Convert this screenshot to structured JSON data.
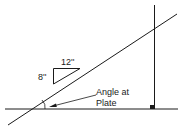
{
  "diagram": {
    "pitch_triangle": {
      "run_label": "12''",
      "rise_label": "8''"
    },
    "callout": {
      "line1": "Angle at",
      "line2": "Plate"
    },
    "colors": {
      "stroke": "#1a1a1a",
      "background": "#ffffff"
    }
  }
}
